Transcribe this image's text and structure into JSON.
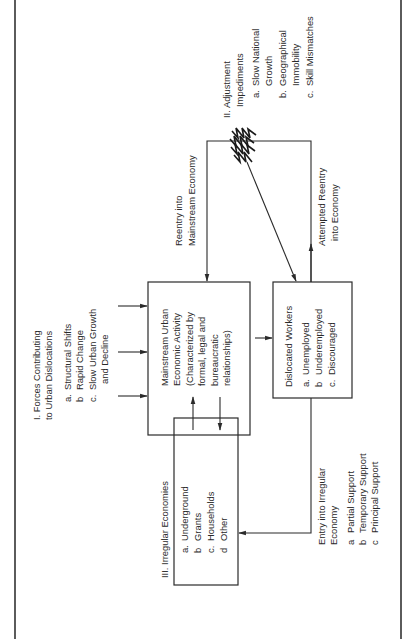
{
  "diagram": {
    "orientation": "rotated 90deg counter-clockwise",
    "forces": {
      "title_lines": [
        "I.  Forces Contributing",
        "     to Urban Dislocations"
      ],
      "items": [
        {
          "marker": "a.",
          "label": "Structural Shifts"
        },
        {
          "marker": "b",
          "label": "Rapid Change"
        },
        {
          "marker": "c.",
          "label": "Slow Urban Growth"
        }
      ],
      "item_c_continuation": "and Decline"
    },
    "mainstream_box": {
      "lines": [
        "Mainstream Urban",
        "Economic Activity",
        "(Characterized by",
        "formal, legal and",
        "bureaucratic",
        "relationships)"
      ]
    },
    "dislocated_box": {
      "title": "Dislocated Workers",
      "items": [
        {
          "marker": "a.",
          "label": "Unemployed"
        },
        {
          "marker": "b",
          "label": "Underemployed"
        },
        {
          "marker": "c.",
          "label": "Discouraged"
        }
      ]
    },
    "irregular_box": {
      "title": "III.  Irregular Economies",
      "items": [
        {
          "marker": "a.",
          "label": "Underground"
        },
        {
          "marker": "b",
          "label": "Grants"
        },
        {
          "marker": "c.",
          "label": "Households"
        },
        {
          "marker": "d",
          "label": "Other"
        }
      ]
    },
    "adjustment": {
      "title_lines": [
        "II.  Adjustment",
        "      Impediments"
      ],
      "items": [
        {
          "marker": "a.",
          "label": "Slow National",
          "cont": "Growth"
        },
        {
          "marker": "b.",
          "label": "Geographical",
          "cont": "Immobility"
        },
        {
          "marker": "c.",
          "label": "Skill Mismatches",
          "cont": ""
        }
      ]
    },
    "reentry_label": [
      "Reentry into",
      "Mainstream Economy"
    ],
    "attempted_label": [
      "Attempted Reentry",
      "into Economy"
    ],
    "entry_irregular": {
      "title_lines": [
        "Entry into Irregular",
        "Economy"
      ],
      "items": [
        {
          "marker": "a",
          "label": "Partial Support"
        },
        {
          "marker": "b",
          "label": "Temporary Support"
        },
        {
          "marker": "c",
          "label": "Principal Support"
        }
      ]
    }
  }
}
